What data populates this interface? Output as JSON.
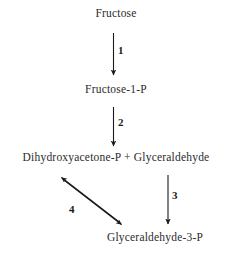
{
  "diagram": {
    "type": "flow-diagram",
    "background_color": "#ffffff",
    "text_color": "#2b2b2b",
    "nodes": [
      {
        "id": "fructose",
        "label": "Fructose"
      },
      {
        "id": "fructose-1-p",
        "label": "Fructose-1-P"
      },
      {
        "id": "dhap-glyceraldehyde",
        "label": "Dihydroxyacetone-P + Glyceraldehyde"
      },
      {
        "id": "glyceraldehyde-3-p",
        "label": "Glyceraldehyde-3-P"
      }
    ],
    "steps": [
      {
        "id": "step-1",
        "label": "1",
        "from": "fructose",
        "to": "fructose-1-p",
        "direction": "down",
        "reversible": false
      },
      {
        "id": "step-2",
        "label": "2",
        "from": "fructose-1-p",
        "to": "dhap-glyceraldehyde",
        "direction": "down",
        "reversible": false
      },
      {
        "id": "step-3",
        "label": "3",
        "from": "dhap-glyceraldehyde",
        "to": "glyceraldehyde-3-p",
        "direction": "down",
        "reversible": false
      },
      {
        "id": "step-4",
        "label": "4",
        "from": "dhap-glyceraldehyde",
        "to": "glyceraldehyde-3-p",
        "direction": "diagonal-down-right",
        "reversible": true
      }
    ]
  }
}
